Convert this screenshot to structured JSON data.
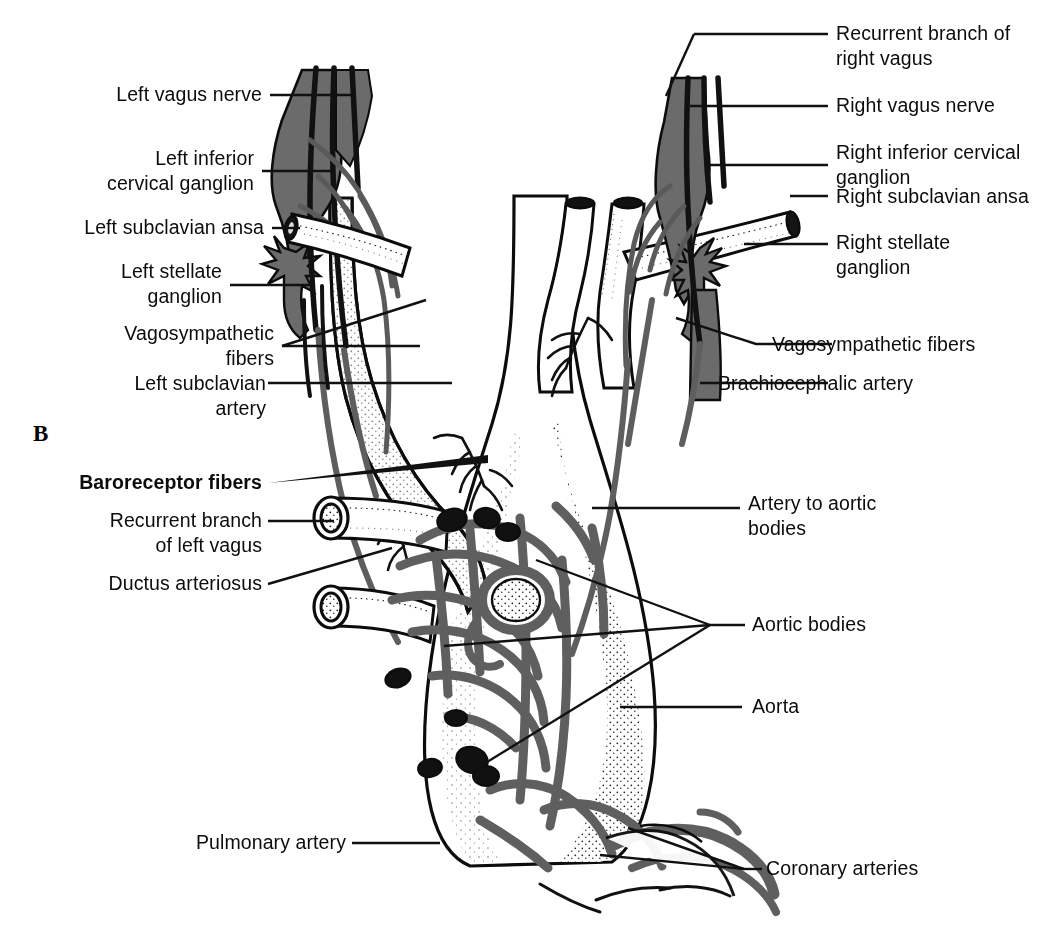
{
  "figure": {
    "panel_letter": "B",
    "type": "anatomical-illustration",
    "colors": {
      "background": "#ffffff",
      "ink": "#0c0c0c",
      "nerve_gray": "#6b6b6b",
      "leader_line": "#111111",
      "stipple": "#1a1a1a"
    }
  },
  "labels_left": [
    {
      "id": "left-vagus-nerve",
      "text": "Left vagus nerve",
      "lines": [
        "Left vagus nerve"
      ]
    },
    {
      "id": "left-inferior-cervical-ganglion",
      "text": "Left inferior cervical ganglion",
      "lines": [
        "Left inferior",
        "cervical ganglion"
      ]
    },
    {
      "id": "left-subclavian-ansa",
      "text": "Left subclavian ansa",
      "lines": [
        "Left subclavian ansa"
      ]
    },
    {
      "id": "left-stellate-ganglion",
      "text": "Left stellate ganglion",
      "lines": [
        "Left stellate",
        "ganglion"
      ]
    },
    {
      "id": "vagosympathetic-fibers-left",
      "text": "Vagosympathetic fibers",
      "lines": [
        "Vagosympathetic",
        "fibers"
      ]
    },
    {
      "id": "left-subclavian-artery",
      "text": "Left subclavian artery",
      "lines": [
        "Left subclavian",
        "artery"
      ]
    },
    {
      "id": "baroreceptor-fibers",
      "text": "Baroreceptor fibers",
      "lines": [
        "Baroreceptor fibers"
      ],
      "emphasis": "bold"
    },
    {
      "id": "recurrent-branch-of-left-vagus",
      "text": "Recurrent branch of left vagus",
      "lines": [
        "Recurrent branch",
        "of left vagus"
      ]
    },
    {
      "id": "ductus-arteriosus",
      "text": "Ductus arteriosus",
      "lines": [
        "Ductus arteriosus"
      ]
    },
    {
      "id": "pulmonary-artery",
      "text": "Pulmonary artery",
      "lines": [
        "Pulmonary artery"
      ]
    }
  ],
  "labels_right": [
    {
      "id": "recurrent-branch-of-right-vagus",
      "text": "Recurrent branch of right vagus",
      "lines": [
        "Recurrent branch of",
        "right vagus"
      ]
    },
    {
      "id": "right-vagus-nerve",
      "text": "Right vagus nerve",
      "lines": [
        "Right vagus nerve"
      ]
    },
    {
      "id": "right-inferior-cervical-ganglion",
      "text": "Right inferior cervical ganglion",
      "lines": [
        "Right inferior cervical",
        "ganglion"
      ]
    },
    {
      "id": "right-subclavian-ansa",
      "text": "Right subclavian ansa",
      "lines": [
        "Right subclavian ansa"
      ]
    },
    {
      "id": "right-stellate-ganglion",
      "text": "Right stellate ganglion",
      "lines": [
        "Right stellate",
        "ganglion"
      ]
    },
    {
      "id": "vagosympathetic-fibers-right",
      "text": "Vagosympathetic fibers",
      "lines": [
        "Vagosympathetic fibers"
      ]
    },
    {
      "id": "brachiocephalic-artery",
      "text": "Brachiocephalic artery",
      "lines": [
        "Brachiocephalic artery"
      ]
    },
    {
      "id": "artery-to-aortic-bodies",
      "text": "Artery to aortic bodies",
      "lines": [
        "Artery to aortic",
        "bodies"
      ]
    },
    {
      "id": "aortic-bodies",
      "text": "Aortic bodies",
      "lines": [
        "Aortic bodies"
      ]
    },
    {
      "id": "aorta",
      "text": "Aorta",
      "lines": [
        "Aorta"
      ]
    },
    {
      "id": "coronary-arteries",
      "text": "Coronary arteries",
      "lines": [
        "Coronary arteries"
      ]
    }
  ],
  "text": {
    "l0": "Left vagus nerve",
    "l1a": "Left inferior",
    "l1b": "cervical ganglion",
    "l2": "Left subclavian ansa",
    "l3a": "Left stellate",
    "l3b": "ganglion",
    "l4a": "Vagosympathetic",
    "l4b": "fibers",
    "l5a": "Left subclavian",
    "l5b": "artery",
    "l6": "Baroreceptor fibers",
    "l7a": "Recurrent branch",
    "l7b": "of left vagus",
    "l8": "Ductus arteriosus",
    "l9": "Pulmonary artery",
    "r0a": "Recurrent branch of",
    "r0b": "right vagus",
    "r1": "Right vagus nerve",
    "r2a": "Right inferior cervical",
    "r2b": "ganglion",
    "r3": "Right subclavian ansa",
    "r4a": "Right stellate",
    "r4b": "ganglion",
    "r5": "Vagosympathetic fibers",
    "r6": "Brachiocephalic artery",
    "r7a": "Artery to aortic",
    "r7b": "bodies",
    "r8": "Aortic bodies",
    "r9": "Aorta",
    "r10": "Coronary arteries",
    "panel": "B"
  }
}
